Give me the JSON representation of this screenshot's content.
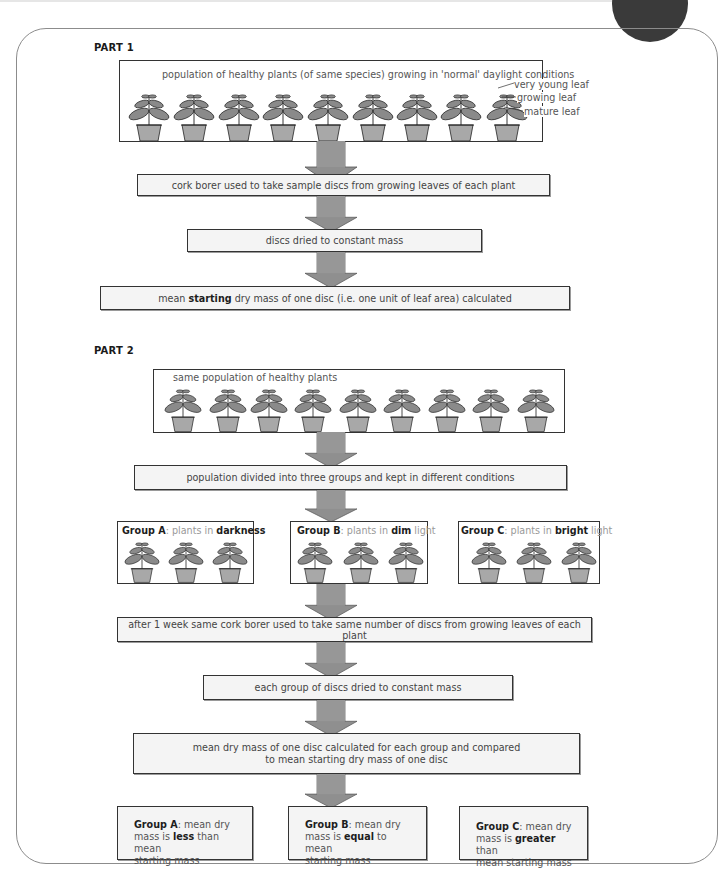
{
  "part1": {
    "heading": "PART 1",
    "population_caption": "population of healthy plants (of same species) growing in 'normal' daylight conditions",
    "plant_count": 9,
    "leaf_labels": [
      "very young leaf",
      "growing leaf",
      "mature leaf"
    ],
    "steps": [
      "cork borer used to take sample discs from growing leaves of each plant",
      "discs dried to constant mass"
    ],
    "final_step": {
      "before": "mean ",
      "bold": "starting",
      "after": " dry mass of one disc (i.e. one unit of leaf area) calculated"
    }
  },
  "part2": {
    "heading": "PART 2",
    "population_caption": "same population of healthy plants",
    "plant_count": 9,
    "divide_step": "population divided into three groups and kept in different conditions",
    "groups": [
      {
        "name": "Group A",
        "pre": ": plants in ",
        "bold": "darkness",
        "post": ""
      },
      {
        "name": "Group B",
        "pre": ": plants in ",
        "bold": "dim",
        "post": " light"
      },
      {
        "name": "Group C",
        "pre": ": plants in ",
        "bold": "bright",
        "post": " light"
      }
    ],
    "steps": [
      "after 1 week same cork borer used to take same number of discs from growing leaves of each plant",
      "each group of discs dried to constant mass"
    ],
    "compare_step": [
      "mean dry mass of one disc calculated for each group and compared",
      "to mean starting dry mass of one disc"
    ],
    "results": [
      {
        "name": "Group A",
        "l1": ": mean dry",
        "l2a": "mass is ",
        "bold": "less",
        "l2b": " than mean",
        "l3": "starting mass"
      },
      {
        "name": "Group B",
        "l1": ": mean dry",
        "l2a": "mass is ",
        "bold": "equal",
        "l2b": " to mean",
        "l3": "starting mass"
      },
      {
        "name": "Group C",
        "l1": ": mean dry",
        "l2a": "mass is ",
        "bold": "greater",
        "l2b": " than",
        "l3": "mean starting mass"
      }
    ]
  },
  "colors": {
    "arrow_fill": "#8f8f8f",
    "arrow_stroke": "#555555",
    "leaf_fill": "#8a8a8a",
    "pot_fill": "#a8a8a8",
    "box_fill": "#f4f4f4"
  }
}
